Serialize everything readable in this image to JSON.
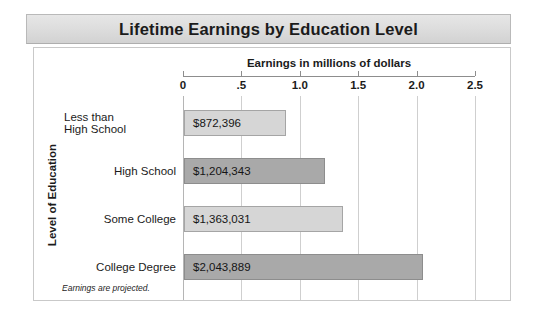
{
  "title": "Lifetime Earnings by Education Level",
  "footnote": "Earnings are projected.",
  "chart_data": {
    "type": "bar",
    "orientation": "horizontal",
    "title": "Lifetime Earnings by Education Level",
    "xlabel": "Earnings in millions of dollars",
    "ylabel": "Level of Education",
    "xlim": [
      0,
      2.5
    ],
    "xticks": [
      "0",
      ".5",
      "1.0",
      "1.5",
      "2.0",
      "2.5"
    ],
    "xtick_values": [
      0,
      0.5,
      1.0,
      1.5,
      2.0,
      2.5
    ],
    "grid": true,
    "legend": "none",
    "categories": [
      "Less than High School",
      "High School",
      "Some College",
      "College Degree"
    ],
    "values": [
      0.872396,
      1.204343,
      1.363031,
      2.043889
    ],
    "data_labels": [
      "$872,396",
      "$1,204,343",
      "$1,363,031",
      "$2,043,889"
    ],
    "bar_colors": [
      "#d6d6d6",
      "#a9a9a9",
      "#d6d6d6",
      "#a9a9a9"
    ],
    "note": "Earnings are projected."
  },
  "bars": [
    {
      "label_line1": "Less than",
      "label_line2": "High School",
      "value_label": "$872,396",
      "value": 0.872396,
      "shade": "light"
    },
    {
      "label_line1": "High School",
      "label_line2": "",
      "value_label": "$1,204,343",
      "value": 1.204343,
      "shade": "dark"
    },
    {
      "label_line1": "Some College",
      "label_line2": "",
      "value_label": "$1,363,031",
      "value": 1.363031,
      "shade": "light"
    },
    {
      "label_line1": "College Degree",
      "label_line2": "",
      "value_label": "$2,043,889",
      "value": 2.043889,
      "shade": "dark"
    }
  ],
  "axis": {
    "x_title": "Earnings in millions of dollars",
    "y_title": "Level of Education",
    "ticks": [
      "0",
      ".5",
      "1.0",
      "1.5",
      "2.0",
      "2.5"
    ]
  }
}
